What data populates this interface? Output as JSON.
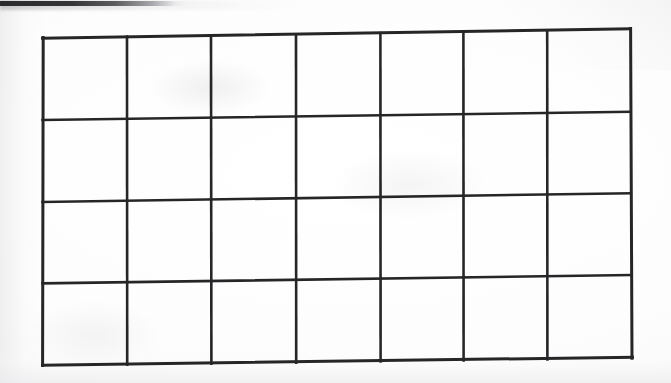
{
  "document": {
    "kind": "scanned-blank-grid-table",
    "background_color": "#fdfdfd",
    "page_color": "#ffffff",
    "line_color": "#262628",
    "artifact": {
      "name": "scan-edge-streak",
      "color": "#2b2b2d",
      "position": "top-left-edge"
    }
  },
  "grid": {
    "columns": 7,
    "rows": 4,
    "cell_count": 28,
    "cells": [
      {
        "row": 1,
        "col": 1,
        "text": ""
      },
      {
        "row": 1,
        "col": 2,
        "text": ""
      },
      {
        "row": 1,
        "col": 3,
        "text": ""
      },
      {
        "row": 1,
        "col": 4,
        "text": ""
      },
      {
        "row": 1,
        "col": 5,
        "text": ""
      },
      {
        "row": 1,
        "col": 6,
        "text": ""
      },
      {
        "row": 1,
        "col": 7,
        "text": ""
      },
      {
        "row": 2,
        "col": 1,
        "text": ""
      },
      {
        "row": 2,
        "col": 2,
        "text": ""
      },
      {
        "row": 2,
        "col": 3,
        "text": ""
      },
      {
        "row": 2,
        "col": 4,
        "text": ""
      },
      {
        "row": 2,
        "col": 5,
        "text": ""
      },
      {
        "row": 2,
        "col": 6,
        "text": ""
      },
      {
        "row": 2,
        "col": 7,
        "text": ""
      },
      {
        "row": 3,
        "col": 1,
        "text": ""
      },
      {
        "row": 3,
        "col": 2,
        "text": ""
      },
      {
        "row": 3,
        "col": 3,
        "text": ""
      },
      {
        "row": 3,
        "col": 4,
        "text": ""
      },
      {
        "row": 3,
        "col": 5,
        "text": ""
      },
      {
        "row": 3,
        "col": 6,
        "text": ""
      },
      {
        "row": 3,
        "col": 7,
        "text": ""
      },
      {
        "row": 4,
        "col": 1,
        "text": ""
      },
      {
        "row": 4,
        "col": 2,
        "text": ""
      },
      {
        "row": 4,
        "col": 3,
        "text": ""
      },
      {
        "row": 4,
        "col": 4,
        "text": ""
      },
      {
        "row": 4,
        "col": 5,
        "text": ""
      },
      {
        "row": 4,
        "col": 6,
        "text": ""
      },
      {
        "row": 4,
        "col": 7,
        "text": ""
      }
    ],
    "geometry": {
      "vertical_line_x": [
        43,
        127,
        211,
        296,
        380,
        463,
        547,
        630
      ],
      "horizontal_line_y_left": [
        38,
        120,
        202,
        283,
        365
      ],
      "horizontal_line_y_right": [
        29,
        112,
        193,
        275,
        358
      ],
      "stroke_width": 2.6
    }
  }
}
